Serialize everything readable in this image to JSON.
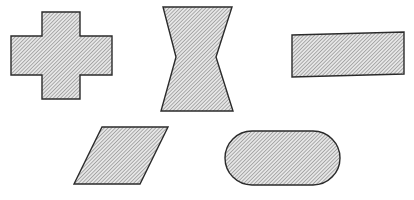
{
  "figure": {
    "background_color": "#ffffff",
    "width": 414,
    "height": 200,
    "outline_color": "#2b2b2b",
    "hatch_color": "#8c8c8c",
    "hatch_fill_color": "#d9d9d9",
    "hatch_angle_degrees": 45,
    "hatch_spacing_px": 2,
    "shape_count": 5,
    "row_counts": [
      3,
      2
    ]
  },
  "shapes": [
    {
      "id": "shape-1",
      "name": "cross",
      "label": "Cross",
      "row": 1,
      "position": 1,
      "bbox": {
        "x": 10,
        "y": 11,
        "width": 103,
        "height": 89
      },
      "points": "42,12 80,12 80,36 112,36 112,75 80,75 80,99 42,99 42,75 11,75 11,36 42,36",
      "vertices": 12,
      "symmetry": "4-fold"
    },
    {
      "id": "shape-2",
      "name": "hourglass",
      "label": "Hourglass",
      "row": 1,
      "position": 2,
      "bbox": {
        "x": 160,
        "y": 6,
        "width": 74,
        "height": 106
      },
      "points": "163,7 232,7 216,57 233,111 161,111 176,57",
      "vertices": 6,
      "symmetry": "horizontal-and-vertical"
    },
    {
      "id": "shape-3",
      "name": "rectangle",
      "label": "Rectangle",
      "row": 1,
      "position": 3,
      "bbox": {
        "x": 292,
        "y": 32,
        "width": 113,
        "height": 45
      },
      "points": "292,35 404,32 404,74 292,77",
      "vertices": 4,
      "symmetry": "2-fold"
    },
    {
      "id": "shape-4",
      "name": "parallelogram",
      "label": "Parallelogram",
      "row": 2,
      "position": 1,
      "bbox": {
        "x": 74,
        "y": 126,
        "width": 95,
        "height": 59
      },
      "points": "102,127 168,127 140,184 74,184",
      "vertices": 4,
      "symmetry": "point"
    },
    {
      "id": "shape-5",
      "name": "dumbbell",
      "label": "Dumbbell",
      "row": 2,
      "position": 2,
      "bbox": {
        "x": 224,
        "y": 130,
        "width": 117,
        "height": 56
      },
      "path": "M 252,131 A 21,21 0 1 0 252,185 L 313,185 A 21,21 0 1 0 313,131 Z",
      "vertices": 0,
      "symmetry": "horizontal-and-vertical"
    }
  ]
}
